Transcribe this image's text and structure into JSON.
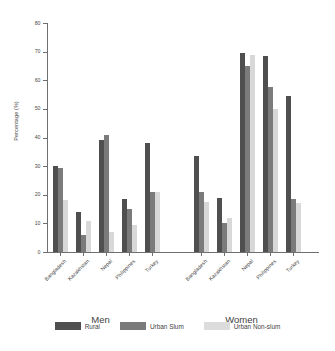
{
  "chart_data": {
    "type": "bar",
    "title": "",
    "xlabel": "",
    "ylabel": "Percentage (%)",
    "ylim": [
      0,
      80
    ],
    "yticks": [
      0,
      10,
      20,
      30,
      40,
      50,
      60,
      70,
      80
    ],
    "grid": false,
    "legend_position": "bottom",
    "categories": [
      "Bangladesh",
      "Kazakhstan",
      "Nepal",
      "Philippines",
      "Turkey"
    ],
    "groups": [
      "Men",
      "Women"
    ],
    "series": [
      {
        "name": "Rural",
        "color": "#4f4f4f",
        "values_by_group": {
          "Men": [
            30.0,
            14.0,
            39.0,
            18.5,
            38.0
          ],
          "Women": [
            33.5,
            19.0,
            69.5,
            68.5,
            54.5
          ]
        }
      },
      {
        "name": "Urban Slum",
        "color": "#7b7b7b",
        "values_by_group": {
          "Men": [
            29.5,
            6.0,
            41.0,
            15.0,
            21.0
          ],
          "Women": [
            21.0,
            10.0,
            65.0,
            57.5,
            18.5
          ]
        }
      },
      {
        "name": "Urban Non-slum",
        "color": "#d8d8d8",
        "values_by_group": {
          "Men": [
            18.0,
            11.0,
            7.0,
            9.5,
            21.0
          ],
          "Women": [
            17.5,
            12.0,
            69.0,
            50.0,
            17.0
          ]
        }
      }
    ]
  },
  "axis": {
    "y_title": "Percentage (%)",
    "y_tick_labels": [
      "0",
      "10",
      "20",
      "30",
      "40",
      "50",
      "60",
      "70",
      "80"
    ]
  },
  "group_labels": [
    "Men",
    "Women"
  ],
  "legend": {
    "items": [
      {
        "label": "Rural",
        "color": "#4f4f4f"
      },
      {
        "label": "Urban Slum",
        "color": "#7b7b7b"
      },
      {
        "label": "Urban Non-slum",
        "color": "#dcdcdc"
      }
    ]
  }
}
